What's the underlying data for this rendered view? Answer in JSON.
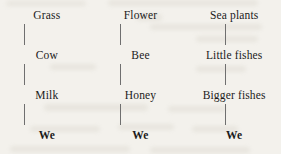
{
  "diagram": {
    "type": "food-chains",
    "background_color": "#f3f1ec",
    "text_color": "#1b1b1b",
    "connector_color": "#6f6f6f",
    "chains": [
      {
        "id": "grass-chain",
        "nodes": [
          "Grass",
          "Cow",
          "Milk",
          "We"
        ]
      },
      {
        "id": "flower-chain",
        "nodes": [
          "Flower",
          "Bee",
          "Honey",
          "We"
        ]
      },
      {
        "id": "sea-chain",
        "nodes": [
          "Sea plants",
          "Little fishes",
          "Bigger fishes",
          "We"
        ]
      }
    ]
  }
}
